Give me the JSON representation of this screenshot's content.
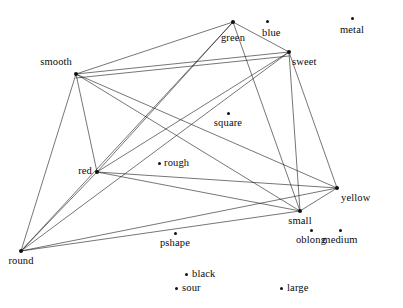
{
  "figure": {
    "type": "graph-diagram",
    "title": "",
    "width": 403,
    "height": 308,
    "background_color": "#ffffff",
    "line_color": "#1a1a1a",
    "node_color": "#111111",
    "text_color": "#0a0a0a"
  },
  "nodes": [
    {
      "id": "green",
      "label": "green",
      "x": 233,
      "y": 22,
      "label_x": 233,
      "label_y": 33,
      "anchor": "center",
      "dot": "large",
      "degree": 5
    },
    {
      "id": "blue",
      "label": "blue",
      "x": 267,
      "y": 21,
      "label_x": 262,
      "label_y": 28,
      "anchor": "right",
      "dot": "small",
      "degree": 0
    },
    {
      "id": "metal",
      "label": "metal",
      "x": 352,
      "y": 18,
      "label_x": 352,
      "label_y": 25,
      "anchor": "center",
      "dot": "small",
      "degree": 0
    },
    {
      "id": "sweet",
      "label": "sweet",
      "x": 289,
      "y": 52,
      "label_x": 292,
      "label_y": 57,
      "anchor": "right",
      "dot": "large",
      "degree": 5
    },
    {
      "id": "smooth",
      "label": "smooth",
      "x": 76,
      "y": 74,
      "label_x": 72,
      "label_y": 57,
      "anchor": "left",
      "dot": "large",
      "degree": 7
    },
    {
      "id": "square",
      "label": "square",
      "x": 228,
      "y": 113,
      "label_x": 228,
      "label_y": 118,
      "anchor": "center",
      "dot": "small",
      "degree": 0
    },
    {
      "id": "rough",
      "label": "rough",
      "x": 159,
      "y": 163,
      "label_x": 164,
      "label_y": 158,
      "anchor": "right",
      "dot": "small",
      "degree": 0
    },
    {
      "id": "red",
      "label": "red",
      "x": 97,
      "y": 172,
      "label_x": 92,
      "label_y": 166,
      "anchor": "left",
      "dot": "large",
      "degree": 7
    },
    {
      "id": "yellow",
      "label": "yellow",
      "x": 337,
      "y": 188,
      "label_x": 341,
      "label_y": 193,
      "anchor": "right",
      "dot": "large",
      "degree": 7
    },
    {
      "id": "small",
      "label": "small",
      "x": 300,
      "y": 211,
      "label_x": 300,
      "label_y": 216,
      "anchor": "center",
      "dot": "large",
      "degree": 7
    },
    {
      "id": "pshape",
      "label": "pshape",
      "x": 175,
      "y": 233,
      "label_x": 175,
      "label_y": 238,
      "anchor": "center",
      "dot": "small",
      "degree": 0
    },
    {
      "id": "oblong",
      "label": "oblong",
      "x": 311,
      "y": 230,
      "label_x": 311,
      "label_y": 235,
      "anchor": "center",
      "dot": "small",
      "degree": 0
    },
    {
      "id": "medium",
      "label": "medium",
      "x": 340,
      "y": 230,
      "label_x": 340,
      "label_y": 235,
      "anchor": "center",
      "dot": "small",
      "degree": 0
    },
    {
      "id": "round",
      "label": "round",
      "x": 21,
      "y": 251,
      "label_x": 21,
      "label_y": 256,
      "anchor": "center",
      "dot": "large",
      "degree": 6
    },
    {
      "id": "black",
      "label": "black",
      "x": 186,
      "y": 274,
      "label_x": 192,
      "label_y": 269,
      "anchor": "right",
      "dot": "small",
      "degree": 0
    },
    {
      "id": "sour",
      "label": "sour",
      "x": 176,
      "y": 288,
      "label_x": 182,
      "label_y": 283,
      "anchor": "right",
      "dot": "small",
      "degree": 0
    },
    {
      "id": "large",
      "label": "large",
      "x": 281,
      "y": 288,
      "label_x": 287,
      "label_y": 283,
      "anchor": "right",
      "dot": "small",
      "degree": 0
    }
  ],
  "edges": [
    {
      "source": "smooth",
      "target": "green"
    },
    {
      "source": "smooth",
      "target": "sweet"
    },
    {
      "source": "smooth",
      "target": "red"
    },
    {
      "source": "smooth",
      "target": "round"
    },
    {
      "source": "smooth",
      "target": "small"
    },
    {
      "source": "smooth",
      "target": "yellow"
    },
    {
      "source": "smooth",
      "target": "sweet2"
    },
    {
      "source": "green",
      "target": "sweet"
    },
    {
      "source": "green",
      "target": "red"
    },
    {
      "source": "green",
      "target": "round"
    },
    {
      "source": "green",
      "target": "small"
    },
    {
      "source": "sweet",
      "target": "red"
    },
    {
      "source": "sweet",
      "target": "round"
    },
    {
      "source": "sweet",
      "target": "small"
    },
    {
      "source": "sweet",
      "target": "yellow"
    },
    {
      "source": "red",
      "target": "round"
    },
    {
      "source": "red",
      "target": "small"
    },
    {
      "source": "red",
      "target": "yellow"
    },
    {
      "source": "round",
      "target": "small"
    },
    {
      "source": "round",
      "target": "yellow"
    },
    {
      "source": "small",
      "target": "yellow"
    }
  ],
  "legend": {
    "visible": false,
    "entries": []
  },
  "chart_data": {
    "type": "scatter",
    "title": "",
    "xlabel": "",
    "ylabel": "",
    "point_labels": [
      "green",
      "blue",
      "metal",
      "sweet",
      "smooth",
      "square",
      "rough",
      "red",
      "yellow",
      "small",
      "pshape",
      "oblong",
      "medium",
      "round",
      "black",
      "sour",
      "large"
    ],
    "x": [
      233,
      267,
      352,
      289,
      76,
      228,
      159,
      97,
      337,
      300,
      175,
      311,
      340,
      21,
      186,
      176,
      281
    ],
    "y": [
      22,
      21,
      18,
      52,
      74,
      113,
      163,
      172,
      188,
      211,
      233,
      230,
      230,
      251,
      274,
      288,
      288
    ],
    "connected_points": [
      "green",
      "sweet",
      "smooth",
      "red",
      "yellow",
      "small",
      "round"
    ],
    "isolated_points": [
      "blue",
      "metal",
      "square",
      "rough",
      "pshape",
      "oblong",
      "medium",
      "black",
      "sour",
      "large"
    ],
    "edge_count": 21,
    "grid": false
  }
}
